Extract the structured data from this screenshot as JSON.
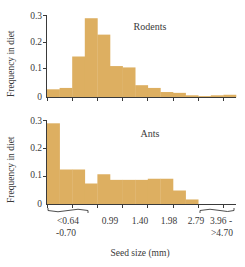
{
  "figure": {
    "xlabel": "Seed size (mm)",
    "ylabel": "Frequency in diet",
    "bar_color": "#ddaf61",
    "axis_color": "#3a3a3a"
  },
  "chart_data": [
    {
      "type": "bar",
      "title": "Rodents",
      "panel_label": "Rodents",
      "xlabel": "Seed size (mm)",
      "ylabel": "Frequency in diet",
      "ylim": [
        0,
        0.3
      ],
      "ytick_labels": [
        "0",
        "0.1",
        "0.2",
        "0.3"
      ],
      "ytick_values": [
        0,
        0.1,
        0.2,
        0.3
      ],
      "xtick_labels": [
        "<0.64\n-0.70",
        "0.99",
        "1.40",
        "1.98",
        "2.79",
        "3.96 -\n>4.70"
      ],
      "categories": [
        "b1",
        "b2",
        "b3",
        "b4",
        "b5",
        "b6",
        "b7",
        "b8",
        "b9",
        "b10",
        "b11",
        "b12",
        "b13",
        "b14",
        "b15"
      ],
      "values": [
        0.03,
        0.035,
        0.15,
        0.29,
        0.23,
        0.115,
        0.11,
        0.045,
        0.035,
        0.02,
        0.017,
        0.008,
        0.005,
        0.008,
        0.01
      ],
      "grid": false,
      "legend": "none"
    },
    {
      "type": "bar",
      "title": "Ants",
      "panel_label": "Ants",
      "xlabel": "Seed size (mm)",
      "ylabel": "Frequency in diet",
      "ylim": [
        0,
        0.3
      ],
      "ytick_labels": [
        "0",
        "0.1",
        "0.2",
        "0.3"
      ],
      "ytick_values": [
        0,
        0.1,
        0.2,
        0.3
      ],
      "xtick_labels": [
        "<0.64\n-0.70",
        "0.99",
        "1.40",
        "1.98",
        "2.79",
        "3.96 -\n>4.70"
      ],
      "categories": [
        "b1",
        "b2",
        "b3",
        "b4",
        "b5",
        "b6",
        "b7",
        "b8",
        "b9",
        "b10",
        "b11",
        "b12",
        "b13",
        "b14",
        "b15"
      ],
      "values": [
        0.29,
        0.125,
        0.125,
        0.075,
        0.108,
        0.088,
        0.088,
        0.088,
        0.092,
        0.092,
        0.05,
        0.018,
        0.0,
        0.0,
        0.0
      ],
      "grid": false,
      "legend": "none"
    }
  ],
  "axes": {
    "y_top": {
      "labels": [
        "0.3",
        "0.2",
        "0.1",
        "0"
      ],
      "title": "Frequency in diet"
    },
    "y_bottom": {
      "labels": [
        "0.3",
        "0.2",
        "0.1",
        "0"
      ],
      "title": "Frequency in diet"
    },
    "x": {
      "label": "Seed size (mm)",
      "ticks": [
        {
          "line1": "<0.64",
          "line2": "-0.70"
        },
        {
          "line1": "0.99",
          "line2": ""
        },
        {
          "line1": "1.40",
          "line2": ""
        },
        {
          "line1": "1.98",
          "line2": ""
        },
        {
          "line1": "2.79",
          "line2": ""
        },
        {
          "line1": "3.96 -",
          "line2": ">4.70"
        }
      ]
    }
  },
  "panels": {
    "top": {
      "label": "Rodents"
    },
    "bottom": {
      "label": "Ants"
    }
  }
}
